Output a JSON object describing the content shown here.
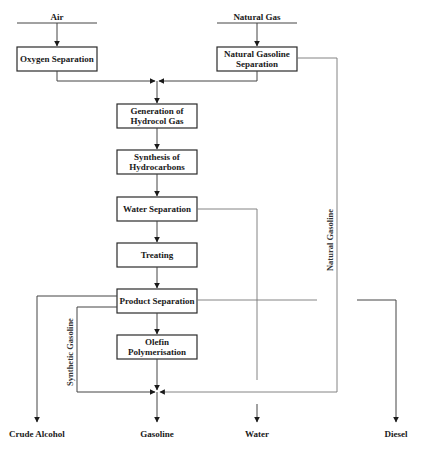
{
  "diagram": {
    "type": "process-flow",
    "inputs": [
      {
        "id": "air",
        "label": "Air"
      },
      {
        "id": "natural-gas",
        "label": "Natural Gas"
      }
    ],
    "process_steps": [
      {
        "id": "oxygen-separation",
        "lines": [
          "Oxygen Separation"
        ]
      },
      {
        "id": "natural-gasoline-separation",
        "lines": [
          "Natural Gasoline",
          "Separation"
        ]
      },
      {
        "id": "generation-of-hydrocol-gas",
        "lines": [
          "Generation of",
          "Hydrocol Gas"
        ]
      },
      {
        "id": "synthesis-of-hydrocarbons",
        "lines": [
          "Synthesis of",
          "Hydrocarbons"
        ]
      },
      {
        "id": "water-separation",
        "lines": [
          "Water Separation"
        ]
      },
      {
        "id": "treating",
        "lines": [
          "Treating"
        ]
      },
      {
        "id": "product-separation",
        "lines": [
          "Product Separation"
        ]
      },
      {
        "id": "olefin-polymerisation",
        "lines": [
          "Olefin",
          "Polymerisation"
        ]
      }
    ],
    "stream_labels": {
      "natural_gasoline": "Natural Gasoline",
      "synthetic_gasoline": "Synthetic Gasoline"
    },
    "outputs": [
      {
        "id": "crude-alcohol",
        "label": "Crude Alcohol"
      },
      {
        "id": "gasoline",
        "label": "Gasoline"
      },
      {
        "id": "water",
        "label": "Water"
      },
      {
        "id": "diesel",
        "label": "Diesel"
      }
    ],
    "connections": [
      [
        "air",
        "oxygen-separation"
      ],
      [
        "natural-gas",
        "natural-gasoline-separation"
      ],
      [
        "oxygen-separation",
        "generation-of-hydrocol-gas"
      ],
      [
        "natural-gasoline-separation",
        "generation-of-hydrocol-gas"
      ],
      [
        "natural-gasoline-separation",
        "gasoline"
      ],
      [
        "generation-of-hydrocol-gas",
        "synthesis-of-hydrocarbons"
      ],
      [
        "synthesis-of-hydrocarbons",
        "water-separation"
      ],
      [
        "water-separation",
        "treating"
      ],
      [
        "water-separation",
        "water"
      ],
      [
        "treating",
        "product-separation"
      ],
      [
        "product-separation",
        "olefin-polymerisation"
      ],
      [
        "product-separation",
        "crude-alcohol"
      ],
      [
        "product-separation",
        "gasoline"
      ],
      [
        "product-separation",
        "diesel"
      ],
      [
        "olefin-polymerisation",
        "gasoline"
      ]
    ]
  }
}
